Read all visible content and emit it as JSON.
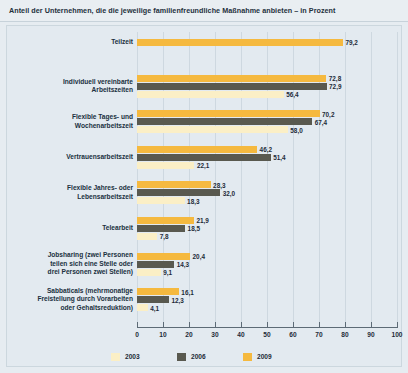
{
  "title": "Anteil der Unternehmen, die die jeweilige familienfreundliche Maßnahme anbieten – in Prozent",
  "legend": {
    "items": [
      {
        "label": "2003",
        "color": "#fbefc6",
        "key": "y2003"
      },
      {
        "label": "2006",
        "color": "#59594f",
        "key": "y2006"
      },
      {
        "label": "2009",
        "color": "#f5b93f",
        "key": "y2009"
      }
    ]
  },
  "axis": {
    "ticks": [
      "0",
      "10",
      "20",
      "30",
      "40",
      "50",
      "60",
      "70",
      "80",
      "90",
      "100"
    ],
    "min": 0,
    "max": 100,
    "step": 10
  },
  "chart_data": {
    "type": "bar",
    "orientation": "horizontal",
    "title": "Anteil der Unternehmen, die die jeweilige familienfreundliche Maßnahme anbieten – in Prozent",
    "xlabel": "",
    "ylabel": "",
    "xlim": [
      0,
      100
    ],
    "grid": true,
    "legend_position": "bottom-left",
    "categories": [
      "Teilzeit",
      "Individuell vereinbarte\nArbeitszeiten",
      "Flexible Tages- und\nWochenarbeitszeit",
      "Vertrauensarbeitszeit",
      "Flexible Jahres- oder\nLebensarbeitszeit",
      "Telearbeit",
      "Jobsharing (zwei Personen\nteilen sich eine Stelle oder\ndrei Personen zwei Stellen)",
      "Sabbaticals (mehrmonatige\nFreistellung durch Vorarbeiten\noder Gehaltsreduktion)"
    ],
    "series": [
      {
        "name": "2009",
        "color": "#f5b93f",
        "values": [
          79.2,
          72.8,
          70.2,
          46.2,
          28.3,
          21.9,
          20.4,
          16.1
        ]
      },
      {
        "name": "2006",
        "color": "#59594f",
        "values": [
          null,
          72.9,
          67.4,
          51.4,
          32.0,
          18.5,
          14.3,
          12.3
        ]
      },
      {
        "name": "2003",
        "color": "#fbefc6",
        "values": [
          null,
          56.4,
          58.0,
          22.1,
          18.3,
          7.8,
          9.1,
          4.1
        ]
      }
    ],
    "value_labels": [
      [
        "79,2",
        null,
        null
      ],
      [
        "72,8",
        "72,9",
        "56,4"
      ],
      [
        "70,2",
        "67,4",
        "58,0"
      ],
      [
        "46,2",
        "51,4",
        "22,1"
      ],
      [
        "28,3",
        "32,0",
        "18,3"
      ],
      [
        "21,9",
        "18,5",
        "7,8"
      ],
      [
        "20,4",
        "14,3",
        "9,1"
      ],
      [
        "16,1",
        "12,3",
        "4,1"
      ]
    ]
  }
}
